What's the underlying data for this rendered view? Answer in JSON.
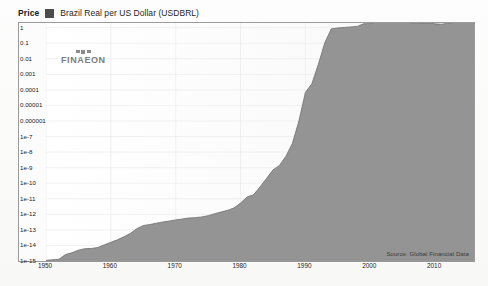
{
  "legend": {
    "price_label": "Price",
    "series_label": "Brazil Real per US Dollar (USDBRL)",
    "swatch_color": "#4c4c4c"
  },
  "watermark": {
    "text": "FINAEON"
  },
  "source_note": "Source: Global Financial Data",
  "bleed_text": "Brazil Real\nper US Dollar\nshows the\nsuccess in",
  "chart_data": {
    "type": "area",
    "title": "Brazil Real per US Dollar (USDBRL)",
    "subtitle": "Price",
    "xlabel": "",
    "ylabel": "",
    "yscale": "log",
    "grid": true,
    "legend_position": "top-left",
    "series_name": "Brazil Real per US Dollar (USDBRL)",
    "line_color": "#6e6e6e",
    "fill_color": "#949494",
    "ylim": [
      1e-15,
      2
    ],
    "xlim": [
      1950,
      2016
    ],
    "ytick_labels": [
      "1",
      "0.1",
      "0.01",
      "0.001",
      "0.0001",
      "0.00001",
      "0.000001",
      "1e-7",
      "1e-8",
      "1e-9",
      "1e-10",
      "1e-11",
      "1e-12",
      "1e-13",
      "1e-14",
      "1e-15"
    ],
    "ytick_values": [
      1,
      0.1,
      0.01,
      0.001,
      0.0001,
      1e-05,
      1e-06,
      1e-07,
      1e-08,
      1e-09,
      1e-10,
      1e-11,
      1e-12,
      1e-13,
      1e-14,
      1e-15
    ],
    "xtick_labels": [
      "1950",
      "1960",
      "1970",
      "1980",
      "1990",
      "2000",
      "2010"
    ],
    "xtick_values": [
      1950,
      1960,
      1970,
      1980,
      1990,
      2000,
      2010
    ],
    "x": [
      1950,
      1951,
      1952,
      1953,
      1954,
      1955,
      1956,
      1957,
      1958,
      1959,
      1960,
      1961,
      1962,
      1963,
      1964,
      1965,
      1966,
      1967,
      1968,
      1969,
      1970,
      1971,
      1972,
      1973,
      1974,
      1975,
      1976,
      1977,
      1978,
      1979,
      1980,
      1981,
      1982,
      1983,
      1984,
      1985,
      1986,
      1987,
      1988,
      1989,
      1990,
      1991,
      1992,
      1993,
      1994,
      1995,
      1996,
      1997,
      1998,
      1999,
      2000,
      2001,
      2002,
      2003,
      2004,
      2005,
      2006,
      2007,
      2008,
      2009,
      2010,
      2011,
      2012,
      2013,
      2014,
      2015,
      2016
    ],
    "values": [
      1.1e-15,
      1.2e-15,
      1.3e-15,
      2.6e-15,
      3.4e-15,
      5e-15,
      6.2e-15,
      6.4e-15,
      7.4e-15,
      1.1e-14,
      1.6e-14,
      2.3e-14,
      3.6e-14,
      5.9e-14,
      1.2e-13,
      1.9e-13,
      2.2e-13,
      2.7e-13,
      3.2e-13,
      3.7e-13,
      4.4e-13,
      5e-13,
      5.8e-13,
      6.1e-13,
      6.8e-13,
      8.2e-13,
      1.1e-12,
      1.4e-12,
      1.8e-12,
      2.6e-12,
      5.3e-12,
      1.3e-11,
      1.8e-11,
      5.8e-11,
      2e-10,
      7.2e-10,
      1.4e-09,
      5.4e-09,
      3.7e-08,
      1e-06,
      6.9e-05,
      0.00025,
      0.0045,
      0.11,
      0.84,
      0.97,
      1.04,
      1.12,
      1.21,
      1.79,
      1.83,
      2.36,
      2.93,
      3.08,
      2.93,
      2.43,
      2.17,
      1.95,
      1.84,
      2.0,
      1.76,
      1.67,
      1.95,
      2.16,
      2.35,
      3.33,
      3.49
    ]
  }
}
